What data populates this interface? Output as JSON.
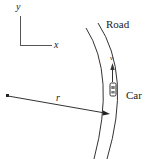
{
  "diagram": {
    "axes": {
      "x_label": "x",
      "y_label": "y"
    },
    "road_label": "Road",
    "car_label": "Car",
    "velocity_label": "v",
    "radius_label": "r",
    "colors": {
      "line": "#333333",
      "background": "#ffffff"
    }
  }
}
